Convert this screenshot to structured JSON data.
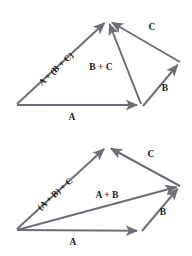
{
  "figure": {
    "background_color": "#ffffff",
    "vector_color": "#6e6e78",
    "label_color": "#1a1a1a",
    "width": 192,
    "height": 256
  },
  "diagrams": [
    {
      "id": "top",
      "caption": "A + (B + C)",
      "labels": {
        "sum_all": "A + (B + C)",
        "sum_partial": "B + C",
        "vec_a": "A",
        "vec_b": "B",
        "vec_c": "C"
      },
      "points": {
        "origin": [
          17,
          105
        ],
        "a_tip": [
          141,
          105
        ],
        "apex": [
          108,
          20
        ],
        "right": [
          180,
          62
        ]
      },
      "vectors": [
        {
          "name": "A",
          "from": [
            17,
            105
          ],
          "to": [
            141,
            105
          ]
        },
        {
          "name": "B",
          "from": [
            141,
            105
          ],
          "to": [
            180,
            62
          ]
        },
        {
          "name": "C",
          "from": [
            180,
            62
          ],
          "to": [
            108,
            20
          ]
        },
        {
          "name": "B + C",
          "from": [
            141,
            105
          ],
          "to": [
            108,
            20
          ]
        },
        {
          "name": "A + (B + C)",
          "from": [
            17,
            105
          ],
          "to": [
            108,
            20
          ]
        }
      ]
    },
    {
      "id": "bottom",
      "caption": "(A + B) + C",
      "labels": {
        "sum_all": "(A + B) + C",
        "sum_partial": "A + B",
        "vec_a": "A",
        "vec_b": "B",
        "vec_c": "C"
      },
      "points": {
        "origin": [
          17,
          230
        ],
        "a_tip": [
          141,
          231
        ],
        "apex": [
          107,
          146
        ],
        "right": [
          180,
          186
        ]
      },
      "vectors": [
        {
          "name": "A",
          "from": [
            17,
            230
          ],
          "to": [
            141,
            231
          ]
        },
        {
          "name": "B",
          "from": [
            141,
            231
          ],
          "to": [
            180,
            186
          ]
        },
        {
          "name": "C",
          "from": [
            180,
            186
          ],
          "to": [
            107,
            146
          ]
        },
        {
          "name": "A + B",
          "from": [
            17,
            230
          ],
          "to": [
            180,
            186
          ]
        },
        {
          "name": "(A + B) + C",
          "from": [
            17,
            230
          ],
          "to": [
            107,
            146
          ]
        }
      ]
    }
  ]
}
